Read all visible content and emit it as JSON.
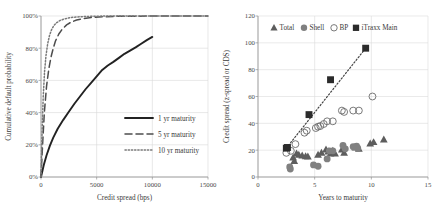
{
  "figure": {
    "panels": [
      "cumulative-default-probability",
      "credit-spread-term-structure"
    ]
  },
  "chart_data": [
    {
      "id": "left",
      "type": "line",
      "title": "",
      "xlabel": "Credit spread (bps)",
      "ylabel": "Cumulative default probability",
      "xlim": [
        0,
        15000
      ],
      "ylim": [
        0,
        1.0
      ],
      "xticks": [
        0,
        5000,
        10000,
        15000
      ],
      "xticklabels": [
        "0",
        "5000",
        "10000",
        "15000"
      ],
      "yticks": [
        0,
        0.2,
        0.4,
        0.6,
        0.8,
        1.0
      ],
      "yticklabels": [
        "0%",
        "20%",
        "40%",
        "60%",
        "80%",
        "100%"
      ],
      "grid": true,
      "legend_position": "center-right",
      "series": [
        {
          "name": "1 yr maturity",
          "style": "solid",
          "color": "#222222",
          "x": [
            0,
            250,
            500,
            800,
            1100,
            1500,
            2000,
            2500,
            3000,
            3500,
            4000,
            4500,
            5000,
            5500,
            6000,
            6500,
            7000,
            7500,
            8000,
            8500,
            9000,
            9500,
            10000
          ],
          "y": [
            0.0,
            0.075,
            0.135,
            0.195,
            0.245,
            0.3,
            0.355,
            0.405,
            0.455,
            0.5,
            0.545,
            0.585,
            0.625,
            0.665,
            0.693,
            0.715,
            0.74,
            0.765,
            0.785,
            0.805,
            0.828,
            0.85,
            0.87
          ]
        },
        {
          "name": "5 yr maturity",
          "style": "dashed",
          "color": "#4d4d4d",
          "x": [
            0,
            150,
            300,
            500,
            700,
            900,
            1100,
            1300,
            1600,
            1900,
            2300,
            2700,
            3200,
            3800,
            4500,
            5500,
            7000,
            9000,
            11000,
            13000,
            15000
          ],
          "y": [
            0.0,
            0.21,
            0.4,
            0.565,
            0.67,
            0.745,
            0.8,
            0.845,
            0.888,
            0.918,
            0.945,
            0.962,
            0.975,
            0.984,
            0.99,
            0.995,
            0.998,
            0.999,
            1.0,
            1.0,
            1.0
          ]
        },
        {
          "name": "10 yr maturity",
          "style": "dotted",
          "color": "#7a7a7a",
          "x": [
            0,
            100,
            200,
            320,
            450,
            600,
            760,
            950,
            1150,
            1400,
            1700,
            2100,
            2600,
            3200,
            4000,
            5000,
            6500,
            8500,
            11000,
            13000,
            15000
          ],
          "y": [
            0.0,
            0.285,
            0.5,
            0.655,
            0.755,
            0.828,
            0.878,
            0.915,
            0.94,
            0.958,
            0.972,
            0.982,
            0.99,
            0.994,
            0.997,
            0.999,
            1.0,
            1.0,
            1.0,
            1.0,
            1.0
          ]
        }
      ]
    },
    {
      "id": "right",
      "type": "scatter",
      "title": "",
      "xlabel": "Years to maturity",
      "ylabel": "Credit spread (z-spread or CDS)",
      "xlim": [
        0,
        15
      ],
      "ylim": [
        0,
        120
      ],
      "xticks": [
        0,
        5,
        10,
        15
      ],
      "xticklabels": [
        "0",
        "5",
        "10",
        "15"
      ],
      "yticks": [
        0,
        20,
        40,
        60,
        80,
        100,
        120
      ],
      "yticklabels": [
        "0",
        "20",
        "40",
        "60",
        "80",
        "100",
        "120"
      ],
      "grid": true,
      "legend_position": "top-center",
      "trendline": {
        "style": "dotted",
        "color": "#444444",
        "x": [
          2.5,
          9.5
        ],
        "y": [
          21.5,
          96.0
        ]
      },
      "series": [
        {
          "name": "Total",
          "marker": "triangle-filled",
          "color": "#5d5d5d",
          "points": [
            [
              3.1,
              14.5
            ],
            [
              3.4,
              17.5
            ],
            [
              3.6,
              16.5
            ],
            [
              3.9,
              16.0
            ],
            [
              4.2,
              15.5
            ],
            [
              4.4,
              15.2
            ],
            [
              3.2,
              12.0
            ],
            [
              5.3,
              16.5
            ],
            [
              5.6,
              18.0
            ],
            [
              6.0,
              20.5
            ],
            [
              6.2,
              19.0
            ],
            [
              6.4,
              17.5
            ],
            [
              6.6,
              19.5
            ],
            [
              6.8,
              17.5
            ],
            [
              7.4,
              20.5
            ],
            [
              7.6,
              18.0
            ],
            [
              8.6,
              22.0
            ],
            [
              8.9,
              21.0
            ],
            [
              9.9,
              25.0
            ],
            [
              10.2,
              26.0
            ],
            [
              11.1,
              28.0
            ]
          ]
        },
        {
          "name": "Shell",
          "marker": "circle-filled",
          "color": "#808080",
          "points": [
            [
              2.8,
              7.5
            ],
            [
              2.85,
              6.0
            ],
            [
              4.9,
              9.0
            ],
            [
              5.3,
              8.0
            ],
            [
              6.1,
              13.5
            ],
            [
              6.3,
              19.5
            ],
            [
              6.6,
              19.5
            ],
            [
              7.5,
              23.5
            ],
            [
              7.7,
              21.0
            ],
            [
              8.4,
              22.5
            ],
            [
              8.7,
              23.0
            ],
            [
              8.8,
              21.5
            ]
          ]
        },
        {
          "name": "BP",
          "marker": "circle-open",
          "color": "#6b6b6b",
          "points": [
            [
              2.5,
              18.0
            ],
            [
              2.9,
              19.5
            ],
            [
              3.3,
              24.5
            ],
            [
              4.1,
              33.0
            ],
            [
              4.3,
              34.5
            ],
            [
              5.1,
              36.5
            ],
            [
              5.3,
              37.5
            ],
            [
              5.5,
              38.0
            ],
            [
              5.8,
              39.5
            ],
            [
              6.1,
              41.5
            ],
            [
              6.6,
              41.5
            ],
            [
              7.4,
              49.5
            ],
            [
              7.6,
              48.5
            ],
            [
              8.4,
              49.5
            ],
            [
              8.9,
              49.5
            ],
            [
              10.1,
              60.0
            ]
          ]
        },
        {
          "name": "iTraxx Main",
          "marker": "square-filled",
          "color": "#2b2b2b",
          "points": [
            [
              2.5,
              21.5
            ],
            [
              2.6,
              22.0
            ],
            [
              4.5,
              46.5
            ],
            [
              6.4,
              72.5
            ],
            [
              9.5,
              96.0
            ]
          ]
        }
      ]
    }
  ]
}
